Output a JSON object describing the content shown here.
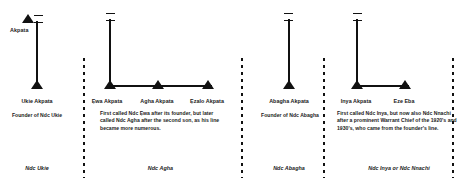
{
  "figure": {
    "type": "genealogy-descent-chart",
    "ink_color": "#111111",
    "background_color": "#ffffff",
    "symbol_legend": {
      "triangle": "male individual",
      "double-bar": "marriage / union tie",
      "vertical-line": "line of descent",
      "horizontal-line": "sibling set"
    }
  },
  "panels": [
    {
      "id": "ndc-ukie",
      "apex_label": "Akpata",
      "children": [
        {
          "name": "Ukie Akpata"
        }
      ],
      "description": "Founder of Ndc Ukie",
      "lineage_label": "Ndc Ukie"
    },
    {
      "id": "ndc-agha",
      "apex_label": "",
      "children": [
        {
          "name": "Ẹwa Akpata"
        },
        {
          "name": "Agha Akpata"
        },
        {
          "name": "Ẹzalo Akpata"
        }
      ],
      "description": "First called Ndc Ẹwa after its founder, but later called Ndc Agha after the second son, as his line became more numerous.",
      "lineage_label": "Ndc Agha"
    },
    {
      "id": "ndc-abagha",
      "apex_label": "",
      "children": [
        {
          "name": "Abagha Akpata"
        }
      ],
      "description": "Founder of Ndc Abagha",
      "lineage_label": "Ndc Abagha"
    },
    {
      "id": "ndc-inya",
      "apex_label": "",
      "children": [
        {
          "name": "Inya Akpata"
        },
        {
          "name": "Eze Eba"
        }
      ],
      "description": "First called Ndc Inya, but now also Ndc Nnachi after a prominent Warrant Chief of the 1920's and 1930's, who came from the founder's line.",
      "lineage_label": "Ndc Inya or Ndc Nnachi"
    }
  ]
}
